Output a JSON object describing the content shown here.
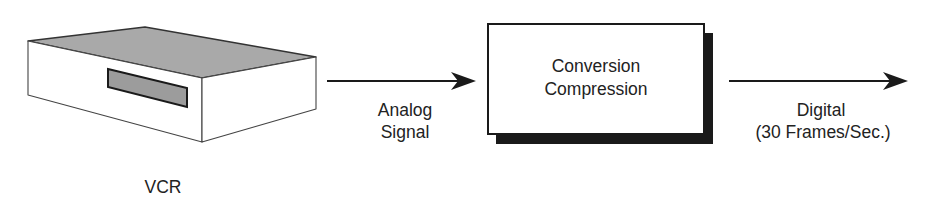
{
  "diagram": {
    "type": "flowchart",
    "direction": "left-to-right",
    "colors": {
      "stroke": "#222222",
      "vcr_top_face": "#a9a9a9",
      "vcr_slot": "#9c9c9c",
      "vcr_side": "#ffffff",
      "box_fill": "#ffffff",
      "box_shadow": "#1a1a1a",
      "text": "#222222"
    },
    "nodes": [
      {
        "id": "vcr",
        "shape": "3d-box-device",
        "label": "VCR"
      },
      {
        "id": "converter",
        "shape": "rectangle-with-drop-shadow",
        "label_lines": [
          "Conversion",
          "Compression"
        ]
      }
    ],
    "edges": [
      {
        "from": "vcr",
        "to": "converter",
        "label_lines": [
          "Analog",
          "Signal"
        ]
      },
      {
        "from": "converter",
        "to": "output",
        "label_lines": [
          "Digital",
          "(30 Frames/Sec.)"
        ]
      }
    ]
  }
}
